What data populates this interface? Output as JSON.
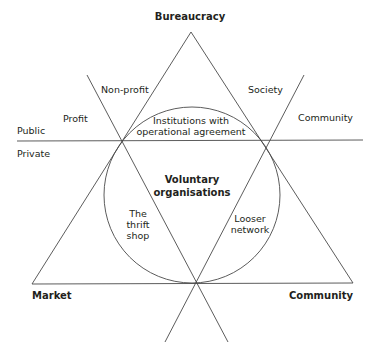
{
  "diagram": {
    "title": "Voluntary organisations",
    "vertices": {
      "top": "Bureaucracy",
      "bottom_left": "Market",
      "bottom_right": "Community"
    },
    "axis_labels": {
      "public": "Public",
      "private": "Private",
      "profit": "Profit",
      "non_profit": "Non-profit",
      "society": "Society",
      "community": "Community"
    },
    "center": {
      "line1": "Voluntary",
      "line2": "organisations"
    },
    "regions": {
      "top": {
        "line1": "Institutions with",
        "line2": "operational agreement"
      },
      "left": {
        "line1": "The",
        "line2": "thrift",
        "line3": "shop"
      },
      "right": {
        "line1": "Looser",
        "line2": "network"
      }
    },
    "colors": {
      "line": "#4a4a4a",
      "text": "#231f20",
      "background": "#ffffff"
    }
  }
}
